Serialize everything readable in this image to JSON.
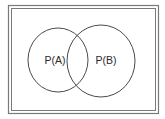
{
  "diagram": {
    "type": "venn",
    "sets": [
      {
        "id": "A",
        "label": "P(A)"
      },
      {
        "id": "B",
        "label": "P(B)"
      }
    ],
    "colors": {
      "stroke": "#4a4a4a",
      "frame": "#6a6a6a",
      "background": "#ffffff"
    }
  }
}
